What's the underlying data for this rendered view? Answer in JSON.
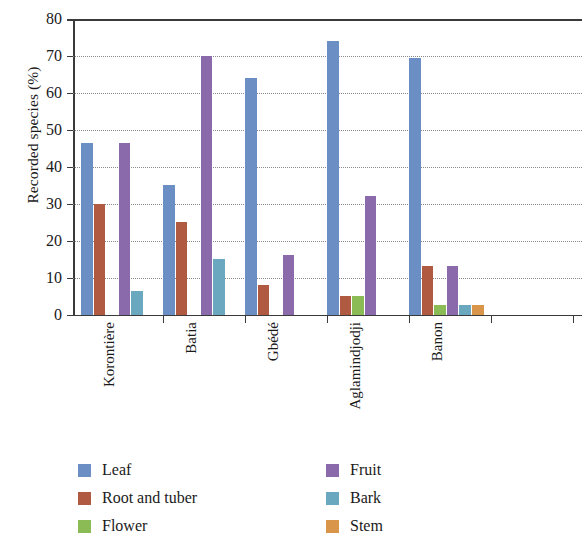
{
  "chart_data": {
    "type": "bar",
    "title": "",
    "subtitle": "",
    "xlabel": "",
    "ylabel": "Recorded species (%)",
    "ylim": [
      0,
      80
    ],
    "ytick_step": 10,
    "yticks": [
      0,
      10,
      20,
      30,
      40,
      50,
      60,
      70,
      80
    ],
    "ytick_labels": [
      "0",
      "10",
      "20",
      "30",
      "40",
      "50",
      "60",
      "70",
      "80"
    ],
    "grid": true,
    "grid_style": "dotted-horizontal",
    "legend_position": "bottom",
    "legend_columns": 2,
    "categories": [
      "Korontière",
      "Batia",
      "Gbédé",
      "Aglamindjodji",
      "Banon"
    ],
    "series": [
      {
        "name": "Leaf",
        "color": "#6b8fc4",
        "values": [
          46.5,
          35,
          64,
          74,
          69.5
        ]
      },
      {
        "name": "Root and tuber",
        "color": "#b05a42",
        "values": [
          30,
          25,
          8,
          5,
          13
        ]
      },
      {
        "name": "Flower",
        "color": "#8bbb55",
        "values": [
          0,
          0,
          0,
          5,
          2.5
        ]
      },
      {
        "name": "Fruit",
        "color": "#8a6aab",
        "values": [
          46.5,
          70,
          16,
          32,
          13
        ]
      },
      {
        "name": "Bark",
        "color": "#6aa8c0",
        "values": [
          6.5,
          15,
          0,
          0,
          2.5
        ]
      },
      {
        "name": "Stem",
        "color": "#d9954a",
        "values": [
          0,
          0,
          0,
          0,
          2.5
        ]
      }
    ]
  },
  "axis": {
    "y_title": "Recorded species (%)"
  },
  "legend": {
    "left_column": [
      "Leaf",
      "Root and tuber",
      "Flower"
    ],
    "right_column": [
      "Fruit",
      "Bark",
      "Stem"
    ]
  }
}
